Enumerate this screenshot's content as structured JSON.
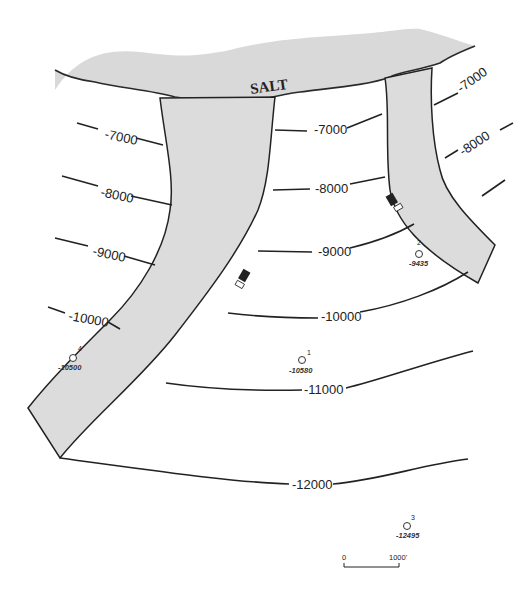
{
  "diagram": {
    "type": "structure contour map",
    "salt_label": "SALT",
    "contours": [
      {
        "id": "c7000_left",
        "label": "-7000"
      },
      {
        "id": "c7000_mid",
        "label": "-7000"
      },
      {
        "id": "c7000_right",
        "label": "-7000"
      },
      {
        "id": "c8000_left",
        "label": "-8000"
      },
      {
        "id": "c8000_mid",
        "label": "-8000"
      },
      {
        "id": "c8000_right",
        "label": "-8000"
      },
      {
        "id": "c9000_left",
        "label": "-9000"
      },
      {
        "id": "c9000_mid",
        "label": "-9000"
      },
      {
        "id": "c10000_left",
        "label": "-10000"
      },
      {
        "id": "c10000_mid",
        "label": "-10000"
      },
      {
        "id": "c11000",
        "label": "-11000"
      },
      {
        "id": "c12000",
        "label": "-12000"
      }
    ],
    "wells": [
      {
        "number": "1",
        "depth": "-10580"
      },
      {
        "number": "2",
        "depth": "-9435"
      },
      {
        "number": "3",
        "depth": "-12495"
      },
      {
        "number": "4",
        "depth": "-10500"
      }
    ],
    "scale_bar": {
      "start": "0",
      "end": "1000'"
    },
    "colors": {
      "fault_fill": "#dcdcdc",
      "salt_fill": "#d9d9d9",
      "line": "#222222"
    }
  }
}
